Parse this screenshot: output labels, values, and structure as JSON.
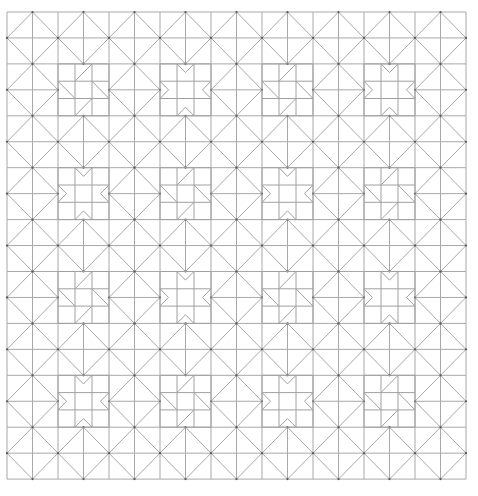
{
  "diagram": {
    "line_color": "#a8a8a8",
    "dot_color": "#555555",
    "background": "#ffffff",
    "origin": {
      "x": 7,
      "y": 12
    },
    "cell_width": 25.5,
    "cell_height": 25.95,
    "columns": 18,
    "rows": 18,
    "diagonal_spacing_cells": 2,
    "star_blocks": {
      "size_cells": 2,
      "start_cells": [
        2,
        6,
        10,
        14
      ],
      "layout": [
        [
          "pinwheel",
          "sawtooth",
          "pinwheel",
          "sawtooth"
        ],
        [
          "sawtooth",
          "pinwheel",
          "sawtooth",
          "pinwheel"
        ],
        [
          "pinwheel",
          "sawtooth",
          "pinwheel",
          "sawtooth"
        ],
        [
          "sawtooth",
          "pinwheel",
          "sawtooth",
          "pinwheel"
        ]
      ]
    }
  }
}
